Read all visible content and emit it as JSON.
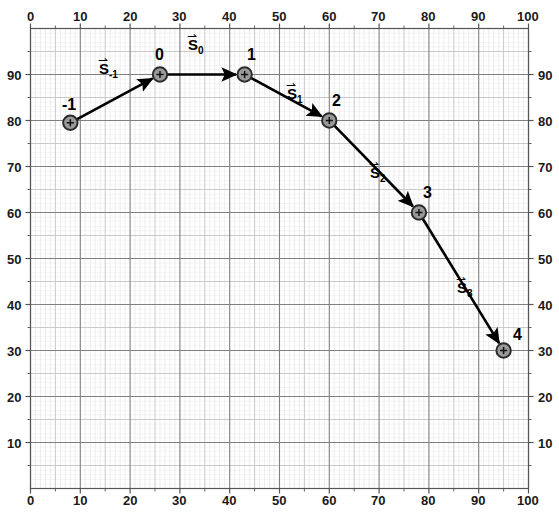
{
  "chart_data": {
    "type": "scatter",
    "title": "",
    "xlabel": "",
    "ylabel": "",
    "xlim": [
      0,
      100
    ],
    "ylim": [
      0,
      100
    ],
    "grid": true,
    "grid_major_step": 10,
    "grid_mid_step": 5,
    "grid_minor_step": 1,
    "legend": "none",
    "x_ticks": [
      "0",
      "10",
      "20",
      "30",
      "40",
      "50",
      "60",
      "70",
      "80",
      "90",
      "100"
    ],
    "x_tick_values": [
      0,
      10,
      20,
      30,
      40,
      50,
      60,
      70,
      80,
      90,
      100
    ],
    "y_ticks": [
      "10",
      "20",
      "30",
      "40",
      "50",
      "60",
      "70",
      "80",
      "90"
    ],
    "y_tick_values": [
      10,
      20,
      30,
      40,
      50,
      60,
      70,
      80,
      90
    ],
    "axes_sides": [
      "top",
      "bottom",
      "left",
      "right"
    ],
    "points": [
      {
        "label": "-1",
        "x": 8,
        "y": 79.5
      },
      {
        "label": "0",
        "x": 26,
        "y": 90
      },
      {
        "label": "1",
        "x": 43,
        "y": 90
      },
      {
        "label": "2",
        "x": 60,
        "y": 80
      },
      {
        "label": "3",
        "x": 78,
        "y": 60
      },
      {
        "label": "4",
        "x": 95,
        "y": 30
      }
    ],
    "vectors": [
      {
        "name": "S",
        "sub": "-1",
        "from": "-1",
        "to": "0",
        "x1": 8,
        "y1": 79.5,
        "x2": 26,
        "y2": 90
      },
      {
        "name": "S",
        "sub": "0",
        "from": "0",
        "to": "1",
        "x1": 26,
        "y1": 90,
        "x2": 43,
        "y2": 90
      },
      {
        "name": "S",
        "sub": "1",
        "from": "1",
        "to": "2",
        "x1": 43,
        "y1": 90,
        "x2": 60,
        "y2": 80
      },
      {
        "name": "S",
        "sub": "2",
        "from": "2",
        "to": "3",
        "x1": 60,
        "y1": 80,
        "x2": 78,
        "y2": 60
      },
      {
        "name": "S",
        "sub": "3",
        "from": "3",
        "to": "4",
        "x1": 78,
        "y1": 60,
        "x2": 95,
        "y2": 30
      }
    ],
    "colors": {
      "series": "#000000",
      "marker_fill": "#9a9a9a",
      "marker_edge": "#2b2b2b",
      "grid_major": "#808080",
      "grid_mid": "#c4c4c4",
      "grid_minor": "#e8e8e8",
      "axis": "#555555",
      "background": "#ffffff",
      "text": "#1a1a1a"
    },
    "vector_arrow_glyph": "⇀"
  }
}
